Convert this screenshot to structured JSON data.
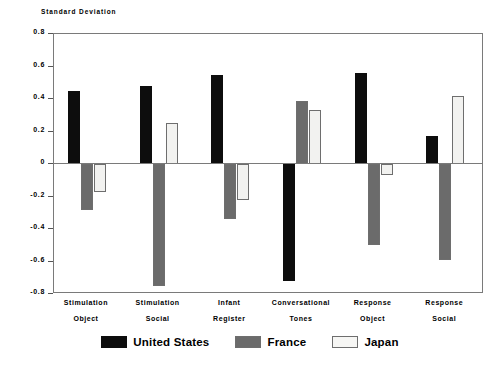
{
  "chart_data": {
    "type": "bar",
    "title": "Standard Deviation",
    "xlabel": "",
    "ylabel": "Standard Deviation",
    "ylim": [
      -0.8,
      0.8
    ],
    "grid": false,
    "legend_position": "bottom",
    "ytick_labels": [
      "0.8",
      "0.6",
      "0.4",
      "0.2",
      "0",
      "-0.2",
      "-0.4",
      "-0.6",
      "-0.8"
    ],
    "ytick_values": [
      0.8,
      0.6,
      0.4,
      0.2,
      0,
      -0.2,
      -0.4,
      -0.6,
      -0.8
    ],
    "categories": [
      "Stimulation Object",
      "Stimulation Social",
      "Infant Register",
      "Conversational Tones",
      "Response Object",
      "Response Social"
    ],
    "category_lines": [
      {
        "line1": "Stimulation",
        "line2": "Object"
      },
      {
        "line1": "Stimulation",
        "line2": "Social"
      },
      {
        "line1": "Infant",
        "line2": "Register"
      },
      {
        "line1": "Conversational",
        "line2": "Tones"
      },
      {
        "line1": "Response",
        "line2": "Object"
      },
      {
        "line1": "Response",
        "line2": "Social"
      }
    ],
    "series": [
      {
        "name": "United States",
        "color": "#0d0d0d",
        "pattern": "solid-black",
        "values": [
          0.45,
          0.48,
          0.55,
          -0.72,
          0.56,
          0.17
        ]
      },
      {
        "name": "France",
        "color": "#6b6b6b",
        "pattern": "stipple-gray",
        "values": [
          -0.28,
          -0.75,
          -0.34,
          0.39,
          -0.5,
          -0.59
        ]
      },
      {
        "name": "Japan",
        "color": "#f2f2f0",
        "pattern": "open-white",
        "values": [
          -0.17,
          0.25,
          -0.22,
          0.33,
          -0.07,
          0.42
        ]
      }
    ]
  },
  "legend": {
    "items": [
      {
        "label": "United States",
        "swatch": "solid-black"
      },
      {
        "label": "France",
        "swatch": "stipple-gray"
      },
      {
        "label": "Japan",
        "swatch": "open-white"
      }
    ]
  }
}
